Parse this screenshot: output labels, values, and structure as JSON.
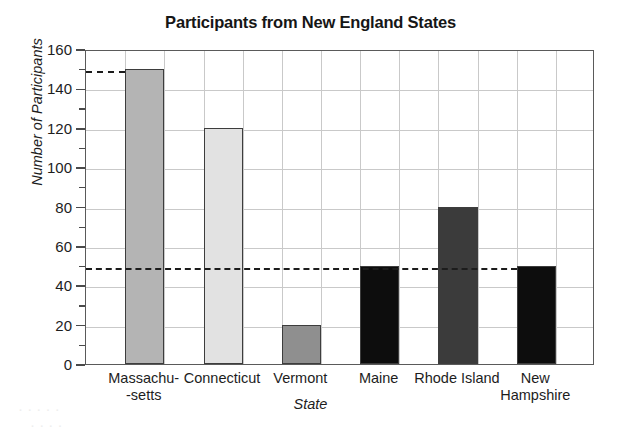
{
  "chart_data": {
    "type": "bar",
    "title": "Participants from New England States",
    "xlabel": "State",
    "ylabel": "Number of Participants",
    "categories": [
      "Massachu--setts",
      "Connecticut",
      "Vermont",
      "Maine",
      "Rhode Island",
      "New Hampshire"
    ],
    "category_lines": [
      [
        "Massachu-",
        "-setts"
      ],
      [
        "Connecticut",
        ""
      ],
      [
        "Vermont",
        ""
      ],
      [
        "Maine",
        ""
      ],
      [
        "Rhode Island",
        ""
      ],
      [
        "New",
        "Hampshire"
      ]
    ],
    "values": [
      150,
      120,
      20,
      50,
      80,
      50
    ],
    "bar_colors": [
      "#b4b4b4",
      "#e2e2e2",
      "#8f8f8f",
      "#0d0d0d",
      "#3b3b3b",
      "#0d0d0d"
    ],
    "ylim": [
      0,
      160
    ],
    "ytick_labels": [
      "0",
      "20",
      "40",
      "60",
      "80",
      "100",
      "120",
      "140",
      "160"
    ],
    "ytick_values": [
      0,
      20,
      40,
      60,
      80,
      100,
      120,
      140,
      160
    ],
    "yminor_values": [
      10,
      30,
      50,
      70,
      90,
      110,
      130,
      150
    ],
    "grid": true,
    "legend": "none",
    "reference_lines": [
      {
        "name": "dashed-reference-150",
        "value": 150,
        "span": "axis-to-massachusetts"
      },
      {
        "name": "dashed-reference-50",
        "value": 50,
        "span": "full-width"
      }
    ]
  },
  "bleed_text": {
    "row1": "·         ·              ·           ·              ·",
    "row2": "·            ·                    ·               ·"
  }
}
